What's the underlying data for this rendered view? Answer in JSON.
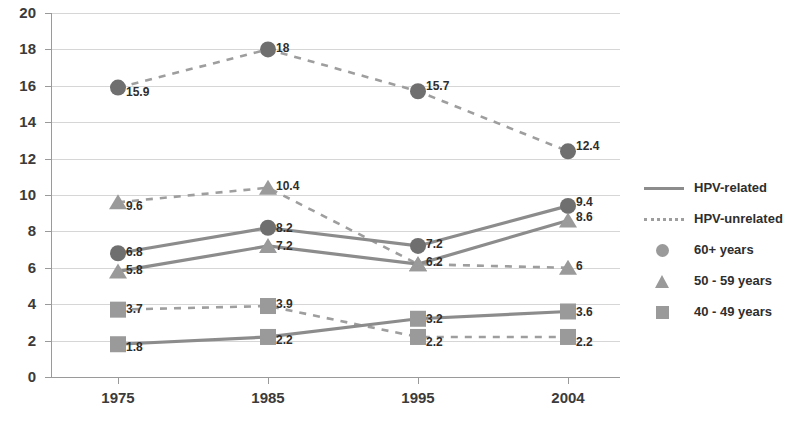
{
  "chart_data": {
    "type": "line",
    "title": "",
    "subtitle": "",
    "xlabel": "",
    "ylabel": "",
    "categories": [
      "1975",
      "1985",
      "1995",
      "2004"
    ],
    "ylim": [
      0,
      20
    ],
    "ytick_step": 2,
    "yticks": [
      "0",
      "2",
      "4",
      "6",
      "8",
      "10",
      "12",
      "14",
      "16",
      "18",
      "20"
    ],
    "grid": true,
    "legend_position": "right",
    "legend": [
      {
        "label": "HPV-related",
        "key": "solid-line"
      },
      {
        "label": "HPV-unrelated",
        "key": "dotted-line"
      },
      {
        "label": "60+ years",
        "key": "circle-marker"
      },
      {
        "label": "50 - 59 years",
        "key": "triangle-marker"
      },
      {
        "label": "40 - 49 years",
        "key": "square-marker"
      }
    ],
    "series": [
      {
        "name": "HPV-unrelated, 60+ years",
        "line_style": "dotted",
        "marker": "circle",
        "values": [
          15.9,
          18,
          15.7,
          12.4
        ],
        "labels": [
          "15.9",
          "18",
          "15.7",
          "12.4"
        ]
      },
      {
        "name": "HPV-unrelated, 50 - 59 years",
        "line_style": "dotted",
        "marker": "triangle",
        "values": [
          9.6,
          10.4,
          6.2,
          6
        ],
        "labels": [
          "9.6",
          "10.4",
          "",
          "6"
        ]
      },
      {
        "name": "HPV-unrelated, 40 - 49 years",
        "line_style": "dotted",
        "marker": "square",
        "values": [
          3.7,
          3.9,
          2.2,
          2.2
        ],
        "labels": [
          "3.7",
          "3.9",
          "2.2",
          "2.2"
        ]
      },
      {
        "name": "HPV-related, 60+ years",
        "line_style": "solid",
        "marker": "circle",
        "values": [
          6.8,
          8.2,
          7.2,
          9.4
        ],
        "labels": [
          "6.8",
          "8.2",
          "7.2",
          "9.4"
        ]
      },
      {
        "name": "HPV-related, 50 - 59 years",
        "line_style": "solid",
        "marker": "triangle",
        "values": [
          5.8,
          7.2,
          6.2,
          8.6
        ],
        "labels": [
          "5.8",
          "7.2",
          "6.2",
          "8.6"
        ]
      },
      {
        "name": "HPV-related, 40 - 49 years",
        "line_style": "solid",
        "marker": "square",
        "values": [
          1.8,
          2.2,
          3.2,
          3.6
        ],
        "labels": [
          "1.8",
          "2.2",
          "3.2",
          "3.6"
        ]
      }
    ],
    "colors": {
      "solid_line": "#8c8c8c",
      "dotted_line": "#9e9e9e",
      "marker": "#9a9a9a",
      "marker_dark": "#6f6f6f",
      "grid": "#d6d6d6",
      "axis": "#9a9a9a",
      "text": "#3b3b3b"
    }
  }
}
